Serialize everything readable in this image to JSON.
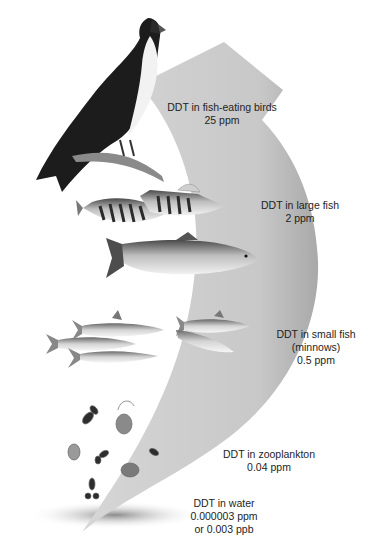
{
  "diagram": {
    "type": "biomagnification-food-chain",
    "arrow_color": "#c9c9c9",
    "arrow_shadow_color": "#9a9a9a",
    "water_shadow_color": "#8c8c8c",
    "levels": [
      {
        "id": "birds",
        "organism": "osprey (fish-eating bird)",
        "line1": "DDT in fish-eating birds",
        "line2": "25 ppm"
      },
      {
        "id": "large-fish",
        "organism": "perch and trout",
        "line1": "DDT in large fish",
        "line2": "2 ppm"
      },
      {
        "id": "small-fish",
        "organism": "minnows",
        "line1": "DDT in small fish",
        "line2": "(minnows)",
        "line3": "0.5 ppm"
      },
      {
        "id": "zooplankton",
        "organism": "zooplankton",
        "line1": "DDT in zooplankton",
        "line2": "0.04 ppm"
      },
      {
        "id": "water",
        "organism": "water",
        "line1": "DDT in water",
        "line2": "0.000003 ppm",
        "line3": "or 0.003 ppb"
      }
    ]
  }
}
